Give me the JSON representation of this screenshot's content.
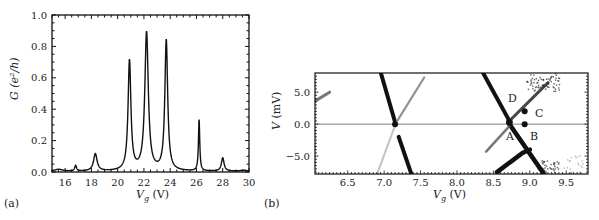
{
  "chart_data": [
    {
      "panel": "(a)",
      "type": "line",
      "xlabel": "V_g (V)",
      "ylabel": "G (e^2/h)",
      "xlim": [
        15,
        30
      ],
      "ylim": [
        0,
        1.0
      ],
      "xticks": [
        "16",
        "18",
        "20",
        "22",
        "24",
        "26",
        "28",
        "30"
      ],
      "yticks": [
        "0.0",
        "0.2",
        "0.4",
        "0.6",
        "0.8",
        "1.0"
      ],
      "grid": false,
      "peaks": [
        {
          "x": 16.8,
          "y": 0.04
        },
        {
          "x": 18.3,
          "y": 0.12
        },
        {
          "x": 20.9,
          "y": 0.74
        },
        {
          "x": 22.2,
          "y": 0.95
        },
        {
          "x": 23.7,
          "y": 0.87
        },
        {
          "x": 26.2,
          "y": 0.33
        },
        {
          "x": 28.0,
          "y": 0.09
        }
      ],
      "valleys": [
        {
          "x": 21.5,
          "y": 0.11
        },
        {
          "x": 23.0,
          "y": 0.06
        }
      ]
    },
    {
      "panel": "(b)",
      "type": "heatmap",
      "xlabel": "V_g (V)",
      "ylabel": "V (mV)",
      "xlim": [
        6.05,
        9.8
      ],
      "ylim": [
        -7.8,
        8.0
      ],
      "xticks": [
        "6.5",
        "7.0",
        "7.5",
        "8.0",
        "8.5",
        "9.0",
        "9.5"
      ],
      "yticks": [
        "5.0",
        "0.0",
        "−5.0"
      ],
      "grid": false,
      "annotations": [
        {
          "label": "A",
          "x": 8.68,
          "y": -2.6
        },
        {
          "label": "B",
          "x": 9.05,
          "y": -2.6
        },
        {
          "label": "C",
          "x": 9.05,
          "y": 2.0
        },
        {
          "label": "D",
          "x": 8.75,
          "y": 4.8
        }
      ],
      "markers": [
        {
          "x": 8.72,
          "y": 0.3
        },
        {
          "x": 8.93,
          "y": 2.0
        },
        {
          "x": 8.93,
          "y": 0.0
        }
      ],
      "diamond_vertices_Vg": [
        7.15,
        8.72
      ]
    }
  ],
  "labels": {
    "panel_a": "(a)",
    "panel_b": "(b)",
    "a_xlabel_main": "V",
    "a_xlabel_sub": "g",
    "a_xlabel_unit": " (V)",
    "a_ylabel": "G (e²/h)",
    "b_xlabel_main": "V",
    "b_xlabel_sub": "g",
    "b_xlabel_unit": " (V)",
    "b_ylabel": "V (mV)",
    "A": "A",
    "B": "B",
    "C": "C",
    "D": "D"
  }
}
